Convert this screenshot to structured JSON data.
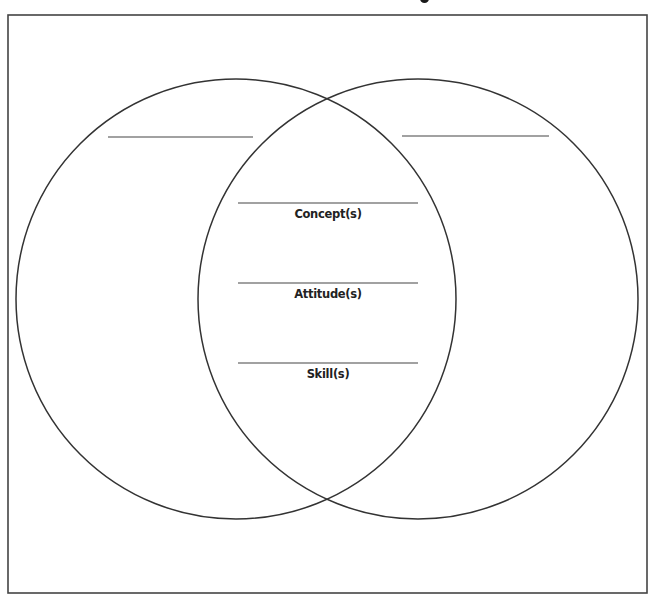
{
  "diagram": {
    "type": "venn-diagram",
    "circle_count": 2,
    "stroke_color": "#333333",
    "frame_color": "#444444",
    "background": "#ffffff",
    "left_circle": {
      "title_blank": ""
    },
    "right_circle": {
      "title_blank": ""
    },
    "overlap": {
      "items": [
        {
          "label": "Concept(s)",
          "blank": ""
        },
        {
          "label": "Attitude(s)",
          "blank": ""
        },
        {
          "label": "Skill(s)",
          "blank": ""
        }
      ]
    }
  }
}
